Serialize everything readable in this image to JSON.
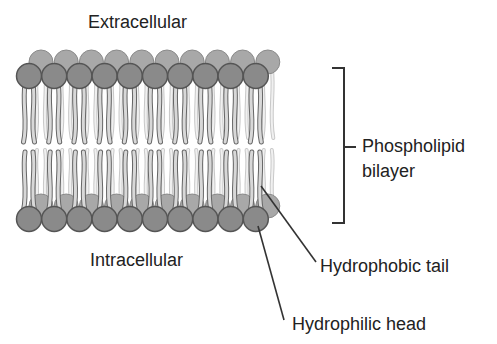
{
  "labels": {
    "extracellular": "Extracellular",
    "intracellular": "Intracellular",
    "bilayer_line1": "Phospholipid",
    "bilayer_line2": "bilayer",
    "tail": "Hydrophobic tail",
    "head": "Hydrophilic head"
  },
  "colors": {
    "head_fill": "#8a8a8a",
    "head_back_fill": "#a8a8a8",
    "head_stroke": "#555555",
    "tail_fill": "#d8d8d8",
    "tail_stroke": "#666666",
    "line": "#333333"
  },
  "diagram": {
    "head_count_per_row": 10
  }
}
